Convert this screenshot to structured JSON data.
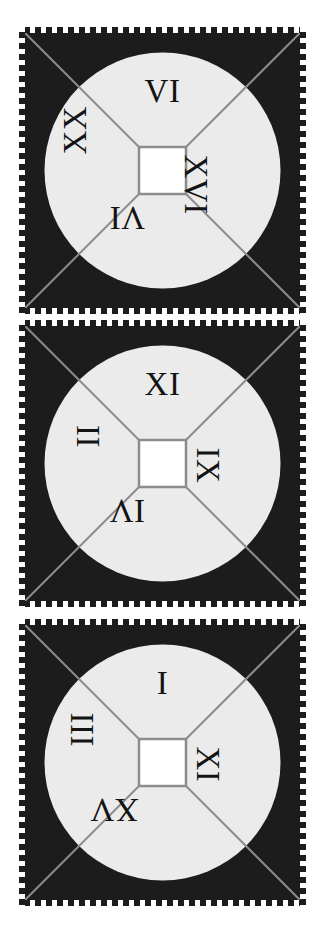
{
  "figure": {
    "background_color": "#ffffff",
    "panel_count": 3,
    "panel_background_color": "#1c1c1c",
    "disc_color": "#ebebeb",
    "hub_color": "#ffffff",
    "line_color": "#8c8c8c",
    "numeral_color": "#131313",
    "border_style": "white-dashed"
  },
  "panels": [
    {
      "id": "panel-1",
      "name": "top-dial",
      "numerals": {
        "top": "VI",
        "right": "XVI",
        "bottom": "VI",
        "left": "XX"
      },
      "rendered_orientation": {
        "top": "upright",
        "right": "rotated-90",
        "bottom": "rotated-180",
        "left": "rotated-270"
      },
      "rendered_glyphs": {
        "top": "VI",
        "right": "XVI",
        "bottom": "IΛ",
        "left": "XX"
      }
    },
    {
      "id": "panel-2",
      "name": "middle-dial",
      "numerals": {
        "top": "XI",
        "right": "IX",
        "bottom": "IV",
        "left": "II"
      },
      "rendered_orientation": {
        "top": "upright",
        "right": "rotated-90",
        "bottom": "rotated-180",
        "left": "rotated-270"
      },
      "rendered_glyphs": {
        "top": "XI",
        "right": "IX",
        "bottom": "ΛI",
        "left": "II"
      }
    },
    {
      "id": "panel-3",
      "name": "bottom-dial",
      "numerals": {
        "top": "I",
        "right": "XI",
        "bottom": "XV",
        "left": "III"
      },
      "rendered_orientation": {
        "top": "upright",
        "right": "rotated-90",
        "bottom": "rotated-180",
        "left": "rotated-270"
      },
      "rendered_glyphs": {
        "top": "I",
        "right": "XI",
        "bottom": "ΛX",
        "left": "III"
      }
    }
  ]
}
